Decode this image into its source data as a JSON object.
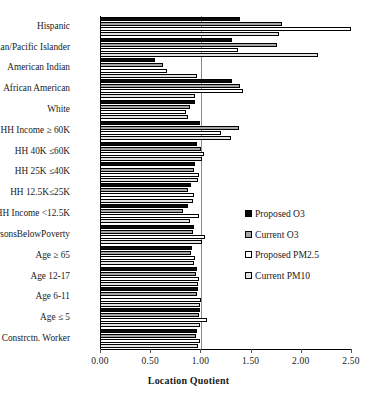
{
  "chart_data": {
    "type": "bar",
    "orientation": "horizontal",
    "title": "",
    "xlabel": "Location Quotient",
    "ylabel": "",
    "xlim": [
      0.0,
      2.5
    ],
    "xticks": [
      "0.00",
      "0.50",
      "1.00",
      "1.50",
      "2.00",
      "2.50"
    ],
    "xtick_values": [
      0.0,
      0.5,
      1.0,
      1.5,
      2.0,
      2.5
    ],
    "grid": "reference line at 1.00",
    "legend_position": "center-right inside plot",
    "categories": [
      "Hispanic",
      "Asian/Pacific Islander",
      "American Indian",
      "African American",
      "White",
      "HH Income ≥ 60K",
      "HH 40K ≤60K",
      "HH 25K ≤40K",
      "HH 12.5K≤25K",
      "HH Income <12.5K",
      "PersonsBelowPoverty",
      "Age ≥ 65",
      "Age 12-17",
      "Age 6-11",
      "Age ≤ 5",
      "Constrctn. Worker"
    ],
    "series": [
      {
        "name": "Proposed O3",
        "color": "#0a0a0a",
        "values": [
          1.39,
          1.31,
          0.55,
          1.31,
          0.95,
          1.0,
          0.97,
          0.95,
          0.91,
          0.88,
          0.94,
          0.92,
          0.97,
          0.98,
          1.0,
          0.97
        ]
      },
      {
        "name": "Current O3",
        "color": "#a6a6a6",
        "values": [
          1.81,
          1.76,
          0.63,
          1.39,
          0.9,
          1.38,
          1.01,
          0.94,
          0.88,
          0.83,
          0.93,
          0.91,
          0.96,
          0.97,
          0.99,
          0.96
        ]
      },
      {
        "name": "Proposed PM2.5",
        "color": "#ffffff",
        "values": [
          2.5,
          1.37,
          0.67,
          1.42,
          0.86,
          1.21,
          1.04,
          0.99,
          0.94,
          0.99,
          1.05,
          0.95,
          0.99,
          1.01,
          1.07,
          1.0
        ]
      },
      {
        "name": "Current PM10",
        "color": "#e2e2e2",
        "values": [
          1.78,
          2.17,
          0.97,
          0.95,
          0.88,
          1.3,
          1.02,
          0.98,
          0.93,
          0.9,
          1.02,
          0.94,
          0.98,
          1.0,
          1.0,
          0.98
        ]
      }
    ]
  },
  "legend": {
    "items": [
      {
        "label": "Proposed O3"
      },
      {
        "label": "Current O3"
      },
      {
        "label": "Proposed PM2.5"
      },
      {
        "label": "Current PM10"
      }
    ]
  }
}
